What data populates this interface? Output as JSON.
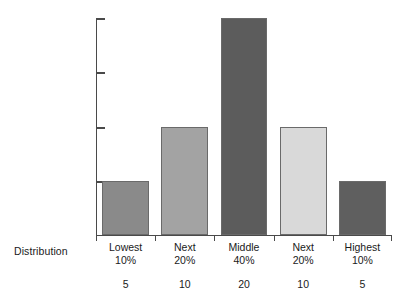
{
  "chart_data": {
    "type": "bar",
    "title": "",
    "subtitle": "",
    "xlabel": "Distribution",
    "ylabel": "",
    "categories": [
      "Lowest\n10%",
      "Next\n20%",
      "Middle\n40%",
      "Next\n20%",
      "Highest\n10%"
    ],
    "category_names": [
      "Lowest",
      "Next",
      "Middle",
      "Next",
      "Highest"
    ],
    "category_percents": [
      "10%",
      "20%",
      "40%",
      "20%",
      "10%"
    ],
    "values": [
      5,
      10,
      20,
      10,
      5
    ],
    "value_labels": [
      "5",
      "10",
      "20",
      "10",
      "5"
    ],
    "ylim": [
      0,
      20
    ],
    "yticks": [
      5,
      10,
      15,
      20
    ],
    "ytick_labels": [
      "",
      "",
      "",
      ""
    ],
    "grid": false,
    "legend": "none",
    "bar_colors": [
      "#8a8a8a",
      "#a3a3a3",
      "#5c5c5c",
      "#d9d9d9",
      "#5f5f5f"
    ],
    "bar_border_color": "#6a6a6a",
    "axis_color": "#4a4a4a",
    "background": "#ffffff"
  },
  "axis": {
    "caption": "Distribution"
  }
}
